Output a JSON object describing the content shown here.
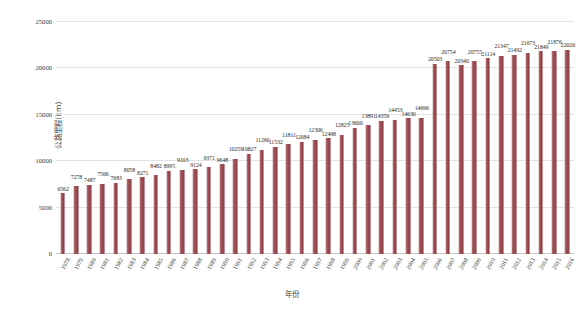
{
  "chart_data": {
    "type": "bar",
    "title": "",
    "xlabel": "年份",
    "ylabel": "公路里程(km)",
    "ylim": [
      0,
      25000
    ],
    "yticks": [
      0,
      5000,
      10000,
      15000,
      20000,
      25000
    ],
    "grid": true,
    "legend": "none",
    "bar_color": "#9e5156",
    "categories": [
      "1978",
      "1979",
      "1980",
      "1981",
      "1982",
      "1983",
      "1984",
      "1985",
      "1986",
      "1987",
      "1988",
      "1989",
      "1990",
      "1991",
      "1992",
      "1993",
      "1994",
      "1995",
      "1996",
      "1997",
      "1998",
      "1999",
      "2000",
      "2001",
      "2002",
      "2003",
      "2004",
      "2005",
      "2006",
      "2007",
      "2008",
      "2009",
      "2010",
      "2011",
      "2012",
      "2013",
      "2014",
      "2015",
      "2016"
    ],
    "values": [
      6562,
      7278,
      7487,
      7566,
      7683,
      8058,
      8271,
      8482,
      8995,
      9103,
      9124,
      9371,
      9648,
      10259,
      10827,
      11260,
      11532,
      11811,
      12084,
      12306,
      12498,
      12825,
      13600,
      13891,
      14359,
      14453,
      14630,
      14696,
      20503,
      20754,
      20340,
      20755,
      21114,
      21347,
      21492,
      21673,
      21849,
      21876,
      22026
    ],
    "value_labels": [
      "6562",
      "7278",
      "7487",
      "7566",
      "7683",
      "8058",
      "8271",
      "8482",
      "8995",
      "9103",
      "9124",
      "9371",
      "9648",
      "10259",
      "10827",
      "11260",
      "11532",
      "11811",
      "12084",
      "12306",
      "12498",
      "12825",
      "13600",
      "13891",
      "14359",
      "14453",
      "14630",
      "14696",
      "20503",
      "20754",
      "20340",
      "20755",
      "21114",
      "21347",
      "21492",
      "21673",
      "21849",
      "21876",
      "22026"
    ]
  }
}
